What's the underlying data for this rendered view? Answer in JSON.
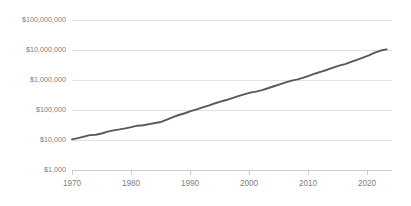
{
  "chart_data": {
    "type": "line",
    "title": "",
    "subtitle": "",
    "xlabel": "",
    "ylabel": "",
    "yscale": "log",
    "xscale": "linear",
    "grid": true,
    "legend": false,
    "legend_position": "none",
    "line_color": "#595959",
    "gridline_color": "#d9d9d9",
    "axis_color": "#c8c8c8",
    "tick_label_color": "#808080",
    "xlim": [
      1970,
      2023.9
    ],
    "ylim": [
      1000,
      100000000
    ],
    "x_ticks": [
      1970,
      1980,
      1990,
      2000,
      2010,
      2020
    ],
    "x_tick_labels": [
      "1970",
      "1980",
      "1990",
      "2000",
      "2010",
      "2020"
    ],
    "y_ticks": [
      1000,
      10000,
      100000,
      1000000,
      10000000,
      100000000
    ],
    "y_tick_labels": [
      "$1,000",
      "$10,000",
      "$100,000",
      "$1,000,000",
      "$10,000,000",
      "$100,000,000"
    ],
    "series": [
      {
        "name": "value",
        "x": [
          1970,
          1971,
          1972,
          1973,
          1974,
          1975,
          1976,
          1977,
          1978,
          1979,
          1980,
          1981,
          1982,
          1983,
          1984,
          1985,
          1986,
          1987,
          1988,
          1989,
          1990,
          1991,
          1992,
          1993,
          1994,
          1995,
          1996,
          1997,
          1998,
          1999,
          2000,
          2001,
          2002,
          2003,
          2004,
          2005,
          2006,
          2007,
          2008,
          2009,
          2010,
          2011,
          2012,
          2013,
          2014,
          2015,
          2016,
          2017,
          2018,
          2019,
          2020,
          2021,
          2022,
          2023
        ],
        "values": [
          10500,
          11500,
          13000,
          14500,
          15000,
          16500,
          19000,
          21000,
          22500,
          24500,
          27000,
          30000,
          31000,
          34000,
          37000,
          40000,
          48000,
          58000,
          68000,
          78000,
          92000,
          105000,
          122000,
          140000,
          165000,
          190000,
          215000,
          250000,
          290000,
          330000,
          380000,
          410000,
          460000,
          530000,
          620000,
          720000,
          830000,
          950000,
          1050000,
          1200000,
          1400000,
          1650000,
          1900000,
          2200000,
          2600000,
          3000000,
          3400000,
          4000000,
          4700000,
          5600000,
          6600000,
          8200000,
          9600000,
          10500000
        ]
      }
    ]
  },
  "plot_geometry": {
    "left": 72,
    "right": 392,
    "top": 20,
    "bottom": 170
  }
}
